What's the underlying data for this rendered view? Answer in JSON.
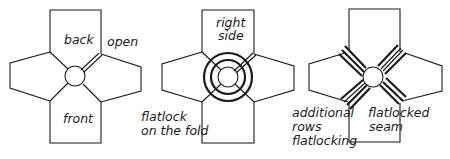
{
  "figures": [
    {
      "id": "fig-open",
      "labels": {
        "back": "back",
        "open": "open",
        "front": "front"
      }
    },
    {
      "id": "fig-flatlock-fold",
      "labels": {
        "right_side_1": "right",
        "right_side_2": "side",
        "flatlock_1": "flatlock",
        "flatlock_2": "on the fold"
      }
    },
    {
      "id": "fig-flatlocked-seam",
      "labels": {
        "additional_1": "additional",
        "additional_2": "rows",
        "additional_3": "flatlocking",
        "seam_1": "flatlocked",
        "seam_2": "seam"
      }
    }
  ],
  "colors": {
    "line": "#1a1a1a",
    "background": "#ffffff"
  }
}
